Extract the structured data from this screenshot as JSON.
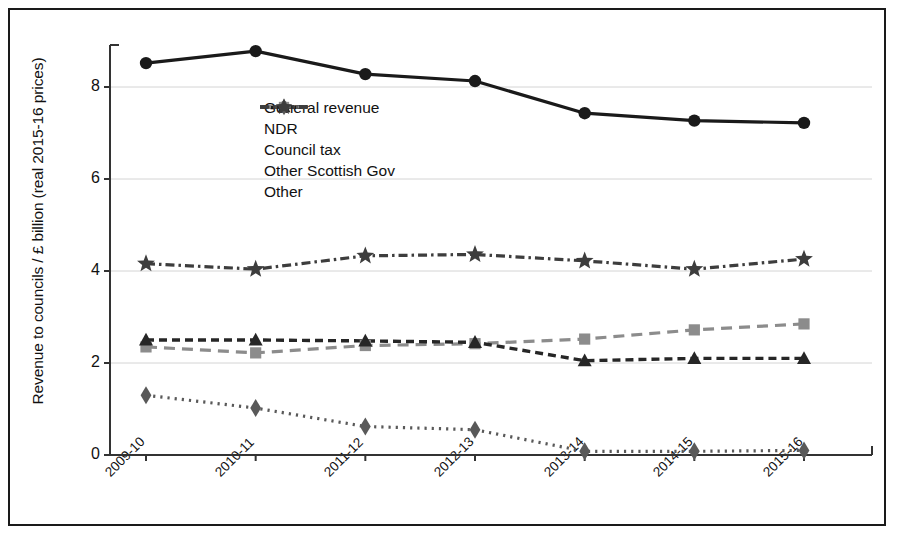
{
  "chart_data": {
    "type": "line",
    "title": "",
    "xlabel": "",
    "ylabel": "Revenue to councils / £ billion (real 2015-16 prices)",
    "categories": [
      "2009-10",
      "2010-11",
      "2011-12",
      "2012-13",
      "2013-14",
      "2014-15",
      "2015-16"
    ],
    "ylim": [
      0,
      9
    ],
    "yticks": [
      0,
      2,
      4,
      6,
      8
    ],
    "ytick_labels": [
      "0",
      "2",
      "4",
      "6",
      "8"
    ],
    "grid": "horizontal",
    "legend_position": "upper-center-left",
    "series": [
      {
        "name": "General revenue",
        "marker": "circle",
        "line": "solid",
        "color": "#1a1a1a",
        "values": [
          8.52,
          8.78,
          8.28,
          8.13,
          7.43,
          7.27,
          7.22
        ]
      },
      {
        "name": "NDR",
        "marker": "square",
        "line": "dashed",
        "color": "#8c8c8c",
        "values": [
          2.35,
          2.22,
          2.38,
          2.42,
          2.52,
          2.72,
          2.85
        ]
      },
      {
        "name": "Council tax",
        "marker": "triangle",
        "line": "dashed-dense",
        "color": "#262626",
        "values": [
          2.5,
          2.5,
          2.48,
          2.45,
          2.05,
          2.1,
          2.1
        ]
      },
      {
        "name": "Other Scottish Gov",
        "marker": "diamond",
        "line": "dotted",
        "color": "#595959",
        "values": [
          1.3,
          1.02,
          0.62,
          0.55,
          0.08,
          0.08,
          0.1
        ]
      },
      {
        "name": "Other",
        "marker": "star",
        "line": "dash-dot",
        "color": "#3d3d3d",
        "values": [
          4.16,
          4.04,
          4.33,
          4.36,
          4.22,
          4.04,
          4.26
        ]
      }
    ]
  },
  "legend": {
    "items": [
      {
        "label": "General revenue"
      },
      {
        "label": "NDR"
      },
      {
        "label": "Council tax"
      },
      {
        "label": "Other Scottish Gov"
      },
      {
        "label": "Other"
      }
    ]
  },
  "colors": {
    "frame": "#1a1a1a",
    "grid": "#d4d4d4",
    "axis": "#333333",
    "background": "#ffffff"
  }
}
